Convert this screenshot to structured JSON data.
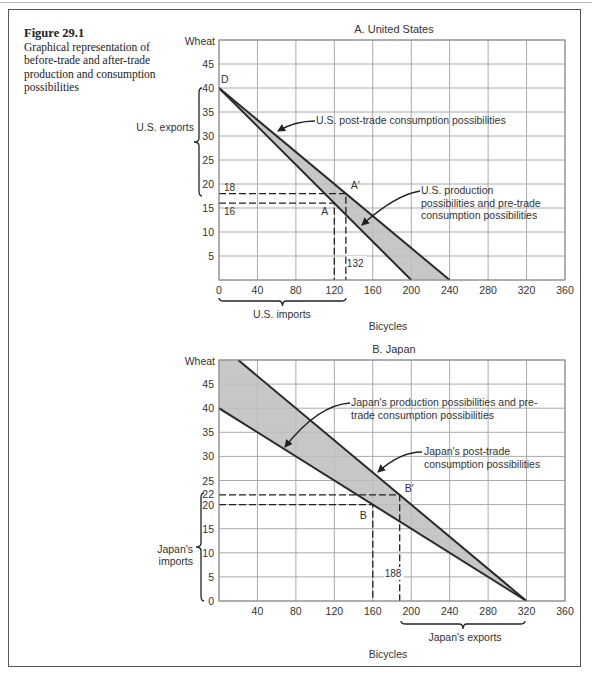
{
  "caption": {
    "figure_label": "Figure 29.1",
    "text": "Graphical representation of before-trade and after-trade production and consumption possibilities"
  },
  "chart_data": [
    {
      "type": "line",
      "title": "A. United States",
      "xlabel": "Bicycles",
      "ylabel": "Wheat",
      "xlim": [
        0,
        360
      ],
      "ylim": [
        0,
        50
      ],
      "x_ticks": [
        0,
        40,
        80,
        120,
        160,
        200,
        240,
        280,
        320,
        360
      ],
      "y_ticks": [
        5,
        10,
        15,
        20,
        25,
        30,
        35,
        40,
        45
      ],
      "grid": true,
      "series": [
        {
          "name": "U.S. production possibilities and pre-trade consumption possibilities",
          "points": [
            [
              0,
              40
            ],
            [
              200,
              0
            ]
          ]
        },
        {
          "name": "U.S. post-trade consumption possibilities",
          "points": [
            [
              0,
              40
            ],
            [
              240,
              0
            ]
          ]
        }
      ],
      "points": [
        {
          "label": "D",
          "x": 0,
          "y": 40
        },
        {
          "label": "A",
          "x": 120,
          "y": 16
        },
        {
          "label": "A′",
          "x": 132,
          "y": 18
        }
      ],
      "annotations": {
        "guide_y_labels": [
          "18",
          "16"
        ],
        "guide_x_label": "132",
        "exports_brace": "U.S. exports",
        "imports_brace": "U.S. imports",
        "post_trade_label": "U.S. post-trade consumption possibilities",
        "ppf_label_lines": [
          "U.S. production",
          "possibilities and pre-trade",
          "consumption possibilities"
        ]
      }
    },
    {
      "type": "line",
      "title": "B. Japan",
      "xlabel": "Bicycles",
      "ylabel": "Wheat",
      "xlim": [
        0,
        360
      ],
      "ylim": [
        0,
        50
      ],
      "x_ticks": [
        40,
        80,
        120,
        160,
        200,
        240,
        280,
        320,
        360
      ],
      "y_ticks": [
        0,
        5,
        10,
        15,
        20,
        25,
        30,
        35,
        40,
        45
      ],
      "grid": true,
      "series": [
        {
          "name": "Japan's production possibilities and pre-trade consumption possibilities",
          "points": [
            [
              0,
              40
            ],
            [
              320,
              0
            ]
          ]
        },
        {
          "name": "Japan's post-trade consumption possibilities",
          "points": [
            [
              20,
              50
            ],
            [
              320,
              0
            ]
          ]
        }
      ],
      "points": [
        {
          "label": "B",
          "x": 160,
          "y": 20
        },
        {
          "label": "B′",
          "x": 188,
          "y": 22
        }
      ],
      "annotations": {
        "guide_y_labels": [
          "22",
          "20"
        ],
        "guide_x_label": "188",
        "imports_brace_lines": [
          "Japan's",
          "imports"
        ],
        "exports_brace": "Japan's exports",
        "ppf_label_lines": [
          "Japan's production possibilities and pre-",
          "trade consumption possibilities"
        ],
        "post_trade_label_lines": [
          "Japan's post-trade",
          "consumption possibilities"
        ]
      }
    }
  ]
}
